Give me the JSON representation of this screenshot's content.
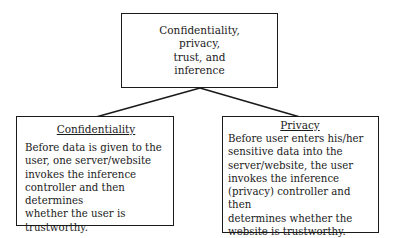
{
  "top": {
    "lines": [
      "Confidentiality,",
      "privacy,",
      "trust, and",
      "inference"
    ]
  },
  "left": {
    "heading": "Confidentiality",
    "body": "Before data is given to the\nuser, one server/website\ninvokes the inference\ncontroller and then determines\nwhether the user is trustworthy."
  },
  "right": {
    "heading": "Privacy",
    "body": "Before user enters his/her\nsensitive data into the\nserver/website, the user\ninvokes the inference\n(privacy) controller and then\ndetermines whether the\nwebsite is trustworthy."
  },
  "colors": {
    "line": "#1a1a1a",
    "background": "#ffffff"
  }
}
